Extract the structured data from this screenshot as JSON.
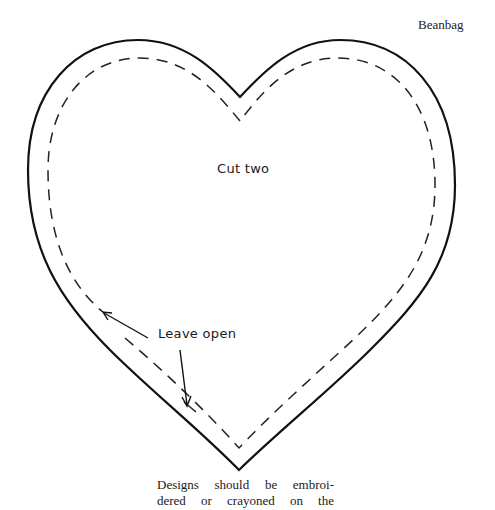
{
  "header": {
    "title": "Beanbag"
  },
  "pattern": {
    "shape": "heart",
    "outline_color": "#111111",
    "stitch_line_color": "#222222",
    "labels": {
      "cut_instruction": "Cut two",
      "opening_instruction": "Leave open"
    }
  },
  "caption": {
    "lines": [
      "Designs should be embroi-",
      "dered or crayoned on the"
    ]
  }
}
